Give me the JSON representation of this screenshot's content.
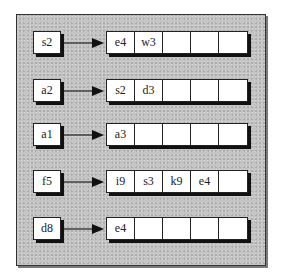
{
  "diagram": {
    "type": "hash-table-chaining",
    "rows": [
      {
        "key": "s2",
        "values": [
          "e4",
          "w3",
          "",
          "",
          ""
        ]
      },
      {
        "key": "a2",
        "values": [
          "s2",
          "d3",
          "",
          "",
          ""
        ]
      },
      {
        "key": "a1",
        "values": [
          "a3",
          "",
          "",
          "",
          ""
        ]
      },
      {
        "key": "f5",
        "values": [
          "i9",
          "s3",
          "k9",
          "e4",
          ""
        ]
      },
      {
        "key": "d8",
        "values": [
          "e4",
          "",
          "",
          "",
          ""
        ]
      }
    ]
  },
  "colors": {
    "background": "#c4c4c4",
    "box": "#ffffff",
    "stroke": "#222222"
  }
}
